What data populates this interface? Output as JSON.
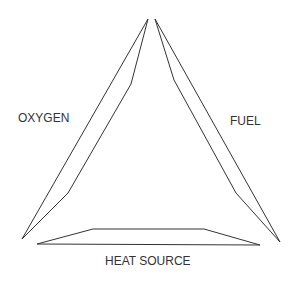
{
  "diagram": {
    "sides": [
      {
        "id": "oxygen",
        "label": "OXYGEN",
        "position": "left"
      },
      {
        "id": "fuel",
        "label": "FUEL",
        "position": "right"
      },
      {
        "id": "heat",
        "label": "HEAT SOURCE",
        "position": "bottom"
      }
    ],
    "stroke_color": "#333333",
    "background": "#ffffff"
  }
}
